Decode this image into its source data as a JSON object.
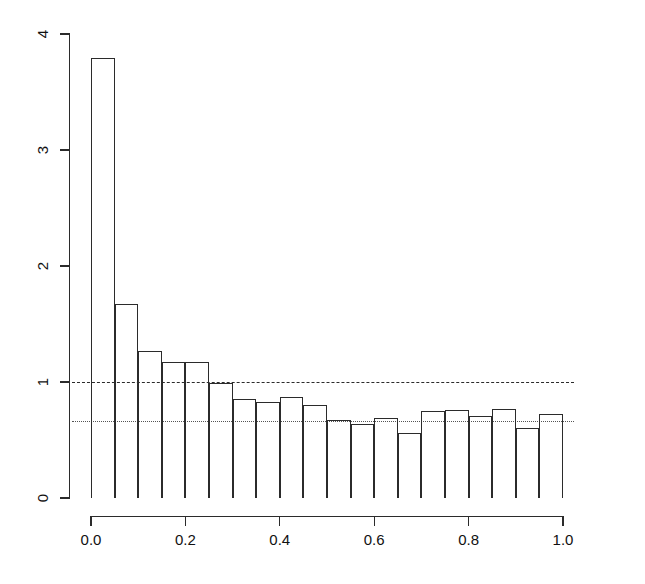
{
  "chart_data": {
    "type": "bar",
    "title": "",
    "subtitle": "",
    "xlabel": "",
    "ylabel": "",
    "xlim": [
      0.0,
      1.0
    ],
    "ylim": [
      0,
      4
    ],
    "grid": false,
    "legend": null,
    "bin_width": 0.05,
    "x_tick_labels": [
      "0.0",
      "0.2",
      "0.4",
      "0.6",
      "0.8",
      "1.0"
    ],
    "x_tick_values": [
      0.0,
      0.2,
      0.4,
      0.6,
      0.8,
      1.0
    ],
    "y_tick_labels": [
      "0",
      "1",
      "2",
      "3",
      "4"
    ],
    "y_tick_values": [
      0,
      1,
      2,
      3,
      4
    ],
    "bin_edges": [
      0.0,
      0.05,
      0.1,
      0.15,
      0.2,
      0.25,
      0.3,
      0.35,
      0.4,
      0.45,
      0.5,
      0.55,
      0.6,
      0.65,
      0.7,
      0.75,
      0.8,
      0.85,
      0.9,
      0.95,
      1.0
    ],
    "categories": [
      "0.00-0.05",
      "0.05-0.10",
      "0.10-0.15",
      "0.15-0.20",
      "0.20-0.25",
      "0.25-0.30",
      "0.30-0.35",
      "0.35-0.40",
      "0.40-0.45",
      "0.45-0.50",
      "0.50-0.55",
      "0.55-0.60",
      "0.60-0.65",
      "0.65-0.70",
      "0.70-0.75",
      "0.75-0.80",
      "0.80-0.85",
      "0.85-0.90",
      "0.90-0.95",
      "0.95-1.00"
    ],
    "values": [
      3.79,
      1.67,
      1.27,
      1.17,
      1.17,
      0.99,
      0.85,
      0.83,
      0.87,
      0.8,
      0.67,
      0.64,
      0.69,
      0.56,
      0.75,
      0.76,
      0.71,
      0.77,
      0.6,
      0.72
    ],
    "annotations": [
      {
        "name": "uniform-density-line",
        "type": "hline",
        "value": 1.0,
        "style": "dashed",
        "color": "#2b2b2b"
      },
      {
        "name": "reference-density-line",
        "type": "hline",
        "value": 0.665,
        "style": "dotted",
        "color": "#555555"
      }
    ],
    "colors": {
      "bar_edge": "#2b2b2b",
      "bar_fill": "transparent",
      "axis": "#2b2b2b",
      "dashed_line": "#2b2b2b",
      "dotted_line": "#555555"
    }
  }
}
